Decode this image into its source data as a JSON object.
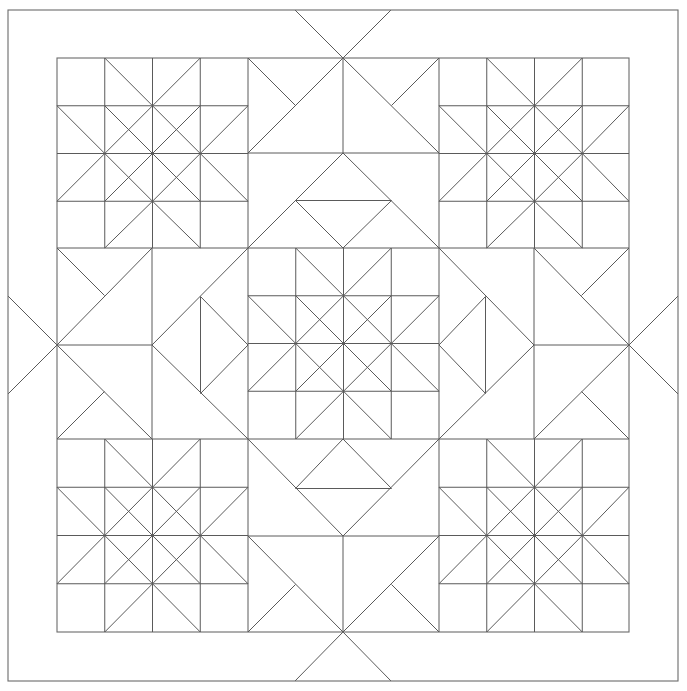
{
  "document": {
    "type": "quilt-pattern-diagram",
    "title": "Quilt Block Layout Diagram",
    "description": "Line-drawing quilt pattern: 3x3 grid of pieced blocks inside a plain border frame",
    "canvas": {
      "width": 687,
      "height": 691,
      "background": "#ffffff"
    },
    "line_color": "#5a5a5a",
    "frame_color": "#6b6b6b",
    "line_width": 1
  },
  "geometry": {
    "outer_frame": {
      "x": 8,
      "y": 10,
      "width": 670,
      "height": 671
    },
    "inner_frame": {
      "x": 57,
      "y": 58,
      "width": 572,
      "height": 574
    },
    "border_width": 49,
    "grid": {
      "columns": 3,
      "rows": 3,
      "block_size": 191,
      "origin_x": 57,
      "origin_y": 58
    },
    "block_cell_divisions": 4,
    "cell_size": 47.75
  },
  "blocks": [
    {
      "row": 0,
      "col": 0,
      "name": "corner-star-top-left",
      "pattern": "sawtooth-star"
    },
    {
      "row": 0,
      "col": 1,
      "name": "edge-block-top-center",
      "pattern": "hourglass-diamond"
    },
    {
      "row": 0,
      "col": 2,
      "name": "corner-star-top-right",
      "pattern": "sawtooth-star"
    },
    {
      "row": 1,
      "col": 0,
      "name": "edge-block-middle-left",
      "pattern": "hourglass-diamond"
    },
    {
      "row": 1,
      "col": 1,
      "name": "center-star",
      "pattern": "sawtooth-star"
    },
    {
      "row": 1,
      "col": 2,
      "name": "edge-block-middle-right",
      "pattern": "hourglass-diamond"
    },
    {
      "row": 2,
      "col": 0,
      "name": "corner-star-bottom-left",
      "pattern": "sawtooth-star"
    },
    {
      "row": 2,
      "col": 1,
      "name": "edge-block-bottom-center",
      "pattern": "hourglass-diamond"
    },
    {
      "row": 2,
      "col": 2,
      "name": "corner-star-bottom-right",
      "pattern": "sawtooth-star"
    }
  ],
  "border_extensions": {
    "description": "Diagonal X rays radiate from each edge-midpoint node out through the plain border into the outer frame",
    "nodes": [
      "top-center",
      "bottom-center",
      "left-middle",
      "right-middle"
    ]
  }
}
